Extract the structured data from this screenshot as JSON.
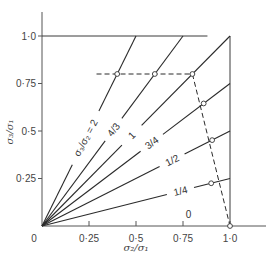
{
  "chart_data": {
    "type": "line",
    "title": "",
    "xlabel": "σ₂/σ₁",
    "ylabel": "σ₃/σ₁",
    "xlim": [
      0,
      1.2
    ],
    "ylim": [
      0,
      1.2
    ],
    "grid": false,
    "legend": "none",
    "x_ticks": [
      {
        "value": 0,
        "label": "0"
      },
      {
        "value": 0.25,
        "label": "0·25"
      },
      {
        "value": 0.5,
        "label": "0·5"
      },
      {
        "value": 0.75,
        "label": "0·75"
      },
      {
        "value": 1.0,
        "label": "1·0"
      }
    ],
    "y_ticks": [
      {
        "value": 0.25,
        "label": "0·25"
      },
      {
        "value": 0.5,
        "label": "0·5"
      },
      {
        "value": 0.75,
        "label": "0·75"
      },
      {
        "value": 1.0,
        "label": "1·0"
      }
    ],
    "series": [
      {
        "name": "σ₃/σ₂ = 2",
        "label": "σ₃/σ₂ = 2",
        "slope": 2,
        "x": [
          0,
          0.5
        ],
        "y": [
          0,
          1.0
        ],
        "label_pos": [
          0.22,
          0.47
        ],
        "label_angle": -62
      },
      {
        "name": "4/3",
        "label": "4/3",
        "slope": 1.3333,
        "x": [
          0,
          0.75
        ],
        "y": [
          0,
          1.0
        ],
        "label_pos": [
          0.35,
          0.53
        ],
        "label_angle": -53
      },
      {
        "name": "1",
        "label": "1",
        "slope": 1,
        "x": [
          0,
          1.0
        ],
        "y": [
          0,
          1.0
        ],
        "label_pos": [
          0.475,
          0.48
        ],
        "label_angle": -45
      },
      {
        "name": "3/4",
        "label": "3/4",
        "slope": 0.75,
        "x": [
          0,
          1.0
        ],
        "y": [
          0,
          0.75
        ],
        "label_pos": [
          0.59,
          0.43
        ],
        "label_angle": -37
      },
      {
        "name": "1/2",
        "label": "1/2",
        "slope": 0.5,
        "x": [
          0,
          1.0
        ],
        "y": [
          0,
          0.5
        ],
        "label_pos": [
          0.7,
          0.33
        ],
        "label_angle": -27
      },
      {
        "name": "1/4",
        "label": "1/4",
        "slope": 0.25,
        "x": [
          0,
          1.0
        ],
        "y": [
          0,
          0.25
        ],
        "label_pos": [
          0.74,
          0.17
        ],
        "label_angle": -14
      },
      {
        "name": "0",
        "label": "0",
        "slope": 0,
        "x": [
          0,
          1.0
        ],
        "y": [
          0,
          0
        ],
        "label_pos": [
          0.78,
          0.04
        ],
        "label_angle": 0
      }
    ],
    "boundary": {
      "top": {
        "x": [
          0,
          0.88
        ],
        "y": [
          1.0,
          1.0
        ]
      },
      "right": {
        "x": [
          1.0,
          1.0
        ],
        "y": [
          0,
          1.0
        ]
      }
    },
    "dashed_path": {
      "x": [
        0.29,
        0.8,
        1.0
      ],
      "y": [
        0.8,
        0.8,
        0
      ]
    },
    "marked_points": [
      {
        "x": 0.4,
        "y": 0.8,
        "series": "2"
      },
      {
        "x": 0.6,
        "y": 0.8,
        "series": "4/3"
      },
      {
        "x": 0.8,
        "y": 0.8,
        "series": "1"
      },
      {
        "x": 0.86,
        "y": 0.645,
        "series": "3/4"
      },
      {
        "x": 0.905,
        "y": 0.452,
        "series": "1/2"
      },
      {
        "x": 0.9,
        "y": 0.225,
        "series": "1/4"
      },
      {
        "x": 1.0,
        "y": 0,
        "series": "0"
      }
    ]
  }
}
